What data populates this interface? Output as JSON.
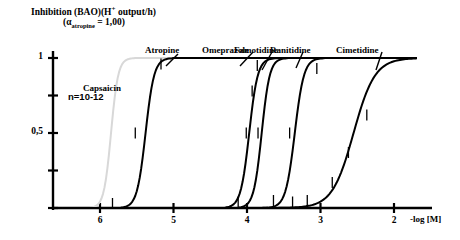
{
  "figure": {
    "title_main": "Inhibition (BAO)(H output/h)",
    "title_main_prefix": "Inhibition (BAO)(H",
    "title_main_sup": "+",
    "title_main_suffix": " output/h)",
    "title_sub_open": "(",
    "title_sub_alpha": "α",
    "title_sub_sub": "atropine",
    "title_sub_rest": " = 1,00)",
    "sample_note": "n=10-12",
    "background": "#ffffff",
    "axis_color": "#000000"
  },
  "chart_data": {
    "type": "line",
    "title": "Inhibition (BAO)(H+ output/h)",
    "subtitle": "(αatropine = 1,00)",
    "xlabel": "-log [M]",
    "ylabel": "Inhibition (BAO)(H+ output/h)",
    "annotation": "n=10-12",
    "xlim": [
      6.5,
      1.7
    ],
    "ylim": [
      0,
      1
    ],
    "x_axis_reversed": true,
    "grid": false,
    "legend_position": "inline-curve-labels",
    "xticks": [
      6,
      5,
      4,
      3,
      2
    ],
    "xtick_labels": [
      "6",
      "5",
      "4",
      "3",
      "2"
    ],
    "yticks": [
      0,
      0.25,
      0.5,
      0.75,
      1
    ],
    "ytick_labels": [
      "",
      "",
      "0,5",
      "",
      "1"
    ],
    "series": [
      {
        "name": "Capsaicin",
        "color": "#d8d8d8",
        "ec50": 5.85,
        "hill": 9.0,
        "top": 1.0,
        "label_x": 5.92,
        "label_y": 0.79,
        "error_bars": []
      },
      {
        "name": "Atropine",
        "color": "#000000",
        "ec50": 5.38,
        "hill": 7.5,
        "top": 1.0,
        "label_x": 5.12,
        "label_y": 1.04,
        "error_bars": [
          {
            "x": 5.83,
            "y": 0.03
          },
          {
            "x": 5.52,
            "y": 0.5
          },
          {
            "x": 5.17,
            "y": 0.96
          }
        ]
      },
      {
        "name": "Omeprazole",
        "color": "#000000",
        "ec50": 3.97,
        "hill": 7.5,
        "top": 1.0,
        "label_x": 4.27,
        "label_y": 1.04,
        "error_bars": [
          {
            "x": 4.12,
            "y": 0.04
          },
          {
            "x": 4.01,
            "y": 0.5
          },
          {
            "x": 3.86,
            "y": 0.95
          }
        ]
      },
      {
        "name": "Famotidine",
        "color": "#000000",
        "ec50": 3.8,
        "hill": 8.0,
        "top": 1.0,
        "label_x": 3.83,
        "label_y": 1.04,
        "error_bars": [
          {
            "x": 3.64,
            "y": 0.05
          },
          {
            "x": 3.93,
            "y": 0.78
          },
          {
            "x": 3.85,
            "y": 0.5
          }
        ]
      },
      {
        "name": "Ranitidine",
        "color": "#000000",
        "ec50": 3.35,
        "hill": 7.0,
        "top": 1.0,
        "label_x": 3.35,
        "label_y": 1.04,
        "error_bars": [
          {
            "x": 3.38,
            "y": 0.04
          },
          {
            "x": 3.42,
            "y": 0.5
          },
          {
            "x": 3.05,
            "y": 0.93
          }
        ]
      },
      {
        "name": "Cimetidine",
        "color": "#000000",
        "ec50": 2.55,
        "hill": 3.0,
        "top": 1.0,
        "label_x": 2.45,
        "label_y": 1.04,
        "error_bars": [
          {
            "x": 3.18,
            "y": 0.05
          },
          {
            "x": 2.84,
            "y": 0.17
          },
          {
            "x": 2.62,
            "y": 0.37
          },
          {
            "x": 2.37,
            "y": 0.62
          }
        ]
      }
    ]
  }
}
